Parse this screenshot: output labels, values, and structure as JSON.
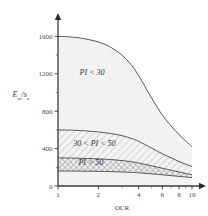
{
  "chart_data": {
    "type": "area",
    "title": "",
    "xlabel": "OCR",
    "ylabel": "E_ur / s_u",
    "ylabel_parts": {
      "main1": "E",
      "sub1": "ur",
      "slash": "/",
      "main2": "s",
      "sub2": "u"
    },
    "xscale": "log",
    "xlim": [
      1,
      10
    ],
    "ylim": [
      0,
      1700
    ],
    "xticks": [
      1,
      2,
      4,
      6,
      8,
      10
    ],
    "xticklabels": [
      "1",
      "2",
      "4",
      "6",
      "8",
      "10"
    ],
    "xminorticks": [
      3,
      5,
      7,
      9
    ],
    "yticks": [
      0,
      400,
      800,
      1200,
      1600
    ],
    "yticklabels": [
      "0",
      "400",
      "800",
      "1200",
      "1600"
    ],
    "grid": false,
    "legend": false,
    "x": [
      1,
      1.2,
      1.5,
      2,
      2.5,
      3,
      3.5,
      4,
      5,
      6,
      7,
      8,
      9,
      10
    ],
    "series": [
      {
        "name": "PI < 30 upper bound",
        "label": "PI < 30",
        "values": [
          1600,
          1595,
          1580,
          1540,
          1480,
          1400,
          1300,
          1180,
          940,
          760,
          640,
          550,
          480,
          420
        ]
      },
      {
        "name": "30 < PI < 50 upper bound",
        "label": "30 < PI < 50",
        "values": [
          600,
          598,
          592,
          578,
          560,
          538,
          510,
          478,
          405,
          345,
          300,
          262,
          232,
          208
        ]
      },
      {
        "name": "PI > 50 upper bound",
        "label": "PI > 50",
        "values": [
          300,
          299,
          296,
          290,
          282,
          272,
          260,
          246,
          216,
          190,
          168,
          150,
          134,
          120
        ]
      },
      {
        "name": "PI > 50 lower bound",
        "label": "",
        "values": [
          160,
          160,
          159,
          157,
          154,
          150,
          146,
          141,
          130,
          120,
          111,
          103,
          96,
          90
        ]
      }
    ],
    "band_labels": [
      {
        "text": "PI < 30",
        "x": 1.45,
        "y": 1190
      },
      {
        "text": "30 < PI < 50",
        "x": 1.3,
        "y": 430
      },
      {
        "text": "PI > 50",
        "x": 1.42,
        "y": 225
      }
    ],
    "colors": {
      "band_light": "#f2f2f2",
      "band_hatch": "#8a8a8a",
      "curve": "#555555",
      "axis": "#3a3a3a",
      "text": "#2e2e2e",
      "background": "#ffffff"
    }
  }
}
